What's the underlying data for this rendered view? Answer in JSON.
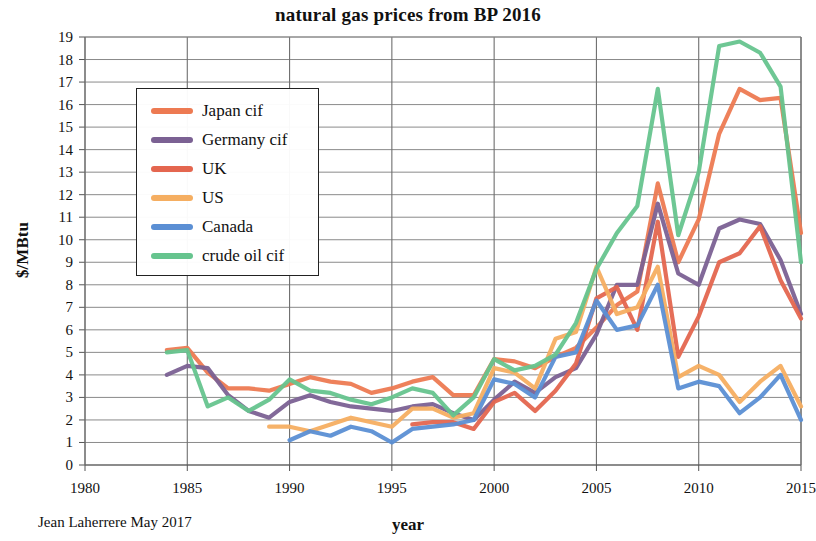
{
  "chart_data": {
    "type": "line",
    "title": "natural gas prices from BP 2016",
    "xlabel": "year",
    "ylabel": "$/MBtu",
    "credit": "Jean Laherrere May 2017",
    "xlim": [
      1980,
      2015
    ],
    "ylim": [
      0,
      19
    ],
    "xticks": [
      1980,
      1985,
      1990,
      1995,
      2000,
      2005,
      2010,
      2015
    ],
    "yticks": [
      0,
      1,
      2,
      3,
      4,
      5,
      6,
      7,
      8,
      9,
      10,
      11,
      12,
      13,
      14,
      15,
      16,
      17,
      18,
      19
    ],
    "grid": true,
    "legend_position": "upper-left-inside",
    "series": [
      {
        "name": "Japan cif",
        "color": "#ED7A52",
        "x": [
          1984,
          1985,
          1986,
          1987,
          1988,
          1989,
          1990,
          1991,
          1992,
          1993,
          1994,
          1995,
          1996,
          1997,
          1998,
          1999,
          2000,
          2001,
          2002,
          2003,
          2004,
          2005,
          2006,
          2007,
          2008,
          2009,
          2010,
          2011,
          2012,
          2013,
          2014,
          2015
        ],
        "y": [
          5.1,
          5.2,
          4.1,
          3.4,
          3.4,
          3.3,
          3.6,
          3.9,
          3.7,
          3.6,
          3.2,
          3.4,
          3.7,
          3.9,
          3.1,
          3.1,
          4.7,
          4.6,
          4.3,
          4.8,
          5.2,
          6.1,
          7.1,
          7.7,
          12.5,
          9.0,
          10.9,
          14.7,
          16.7,
          16.2,
          16.3,
          10.3
        ]
      },
      {
        "name": "Germany cif",
        "color": "#7B6193",
        "x": [
          1984,
          1985,
          1986,
          1987,
          1988,
          1989,
          1990,
          1991,
          1992,
          1993,
          1994,
          1995,
          1996,
          1997,
          1998,
          1999,
          2000,
          2001,
          2002,
          2003,
          2004,
          2005,
          2006,
          2007,
          2008,
          2009,
          2010,
          2011,
          2012,
          2013,
          2014,
          2015
        ],
        "y": [
          4.0,
          4.4,
          4.3,
          3.1,
          2.4,
          2.1,
          2.8,
          3.1,
          2.8,
          2.6,
          2.5,
          2.4,
          2.6,
          2.7,
          2.3,
          2.0,
          2.9,
          3.7,
          3.2,
          3.9,
          4.3,
          5.8,
          8.0,
          8.0,
          11.6,
          8.5,
          8.0,
          10.5,
          10.9,
          10.7,
          9.1,
          6.7
        ]
      },
      {
        "name": "UK",
        "color": "#E4664F",
        "x": [
          1996,
          1997,
          1998,
          1999,
          2000,
          2001,
          2002,
          2003,
          2004,
          2005,
          2006,
          2007,
          2008,
          2009,
          2010,
          2011,
          2012,
          2013,
          2014,
          2015
        ],
        "y": [
          1.8,
          1.9,
          1.9,
          1.6,
          2.8,
          3.2,
          2.4,
          3.3,
          4.5,
          7.4,
          7.9,
          6.0,
          10.8,
          4.8,
          6.6,
          9.0,
          9.4,
          10.6,
          8.2,
          6.5
        ]
      },
      {
        "name": "US",
        "color": "#F5AE61",
        "x": [
          1989,
          1990,
          1991,
          1992,
          1993,
          1994,
          1995,
          1996,
          1997,
          1998,
          1999,
          2000,
          2001,
          2002,
          2003,
          2004,
          2005,
          2006,
          2007,
          2008,
          2009,
          2010,
          2011,
          2012,
          2013,
          2014,
          2015
        ],
        "y": [
          1.7,
          1.7,
          1.5,
          1.8,
          2.1,
          1.9,
          1.7,
          2.5,
          2.5,
          2.1,
          2.3,
          4.3,
          4.1,
          3.4,
          5.6,
          5.9,
          8.8,
          6.7,
          7.0,
          8.8,
          3.9,
          4.4,
          4.0,
          2.8,
          3.7,
          4.4,
          2.6
        ]
      },
      {
        "name": "Canada",
        "color": "#5B8FD4",
        "x": [
          1990,
          1991,
          1992,
          1993,
          1994,
          1995,
          1996,
          1997,
          1998,
          1999,
          2000,
          2001,
          2002,
          2003,
          2004,
          2005,
          2006,
          2007,
          2008,
          2009,
          2010,
          2011,
          2012,
          2013,
          2014,
          2015
        ],
        "y": [
          1.1,
          1.5,
          1.3,
          1.7,
          1.5,
          1.0,
          1.6,
          1.7,
          1.8,
          2.0,
          3.8,
          3.6,
          3.0,
          4.8,
          5.0,
          7.3,
          6.0,
          6.2,
          8.0,
          3.4,
          3.7,
          3.5,
          2.3,
          3.0,
          4.0,
          2.0
        ]
      },
      {
        "name": "crude oil cif",
        "color": "#66C48E",
        "x": [
          1984,
          1985,
          1986,
          1987,
          1988,
          1989,
          1990,
          1991,
          1992,
          1993,
          1994,
          1995,
          1996,
          1997,
          1998,
          1999,
          2000,
          2001,
          2002,
          2003,
          2004,
          2005,
          2006,
          2007,
          2008,
          2009,
          2010,
          2011,
          2012,
          2013,
          2014,
          2015
        ],
        "y": [
          5.0,
          5.1,
          2.6,
          3.0,
          2.4,
          2.9,
          3.8,
          3.3,
          3.2,
          2.9,
          2.7,
          3.0,
          3.4,
          3.2,
          2.2,
          3.0,
          4.7,
          4.2,
          4.4,
          4.9,
          6.3,
          8.7,
          10.3,
          11.5,
          16.7,
          10.2,
          13.0,
          18.6,
          18.8,
          18.3,
          16.8,
          9.0
        ]
      }
    ]
  },
  "legend": {
    "items": [
      {
        "label": "Japan cif",
        "color": "#ED7A52"
      },
      {
        "label": "Germany cif",
        "color": "#7B6193"
      },
      {
        "label": "UK",
        "color": "#E4664F"
      },
      {
        "label": "US",
        "color": "#F5AE61"
      },
      {
        "label": "Canada",
        "color": "#5B8FD4"
      },
      {
        "label": "crude oil cif",
        "color": "#66C48E"
      }
    ]
  },
  "axes": {
    "ytick_labels": [
      "19",
      "18",
      "17",
      "16",
      "15",
      "14",
      "13",
      "12",
      "11",
      "10",
      "9",
      "8",
      "7",
      "6",
      "5",
      "4",
      "3",
      "2",
      "1",
      "0"
    ],
    "xtick_labels": [
      "1980",
      "1985",
      "1990",
      "1995",
      "2000",
      "2005",
      "2010",
      "2015"
    ]
  }
}
